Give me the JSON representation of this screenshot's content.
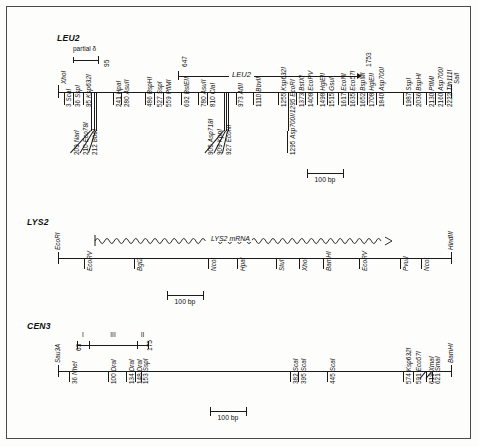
{
  "figure": {
    "title_hidden": "Restriction maps of LEU2, LYS2 and CEN3",
    "scalebar_label": "100 bp"
  },
  "leu2": {
    "title": "LEU2",
    "partial_delta_label": "partial δ",
    "partial_delta_end": "95",
    "left_end_site": "XhoI",
    "right_end_site": "SalI",
    "gene_name": "LEU2",
    "gene_start": "647",
    "gene_end": "1753",
    "scalebar_label": "100 bp",
    "sites_top": [
      {
        "pos": "3",
        "enzyme": "ScaI",
        "x": 56.5
      },
      {
        "pos": "36",
        "enzyme": "SspI",
        "x": 65.5
      },
      {
        "pos": "95",
        "enzyme": "Ksp632I",
        "x": 76.0
      },
      {
        "pos": "241",
        "enzyme": "HpaI",
        "x": 106.0
      },
      {
        "pos": "280",
        "enzyme": "AsuII",
        "x": 114.0
      },
      {
        "pos": "486",
        "enzyme": "BspHI",
        "x": 137.5
      },
      {
        "pos": "527",
        "enzyme": "SspI",
        "x": 147.0
      },
      {
        "pos": "559",
        "enzyme": "PflMI",
        "x": 156.0
      },
      {
        "pos": "692",
        "enzyme": "BstEII",
        "x": 174.0
      },
      {
        "pos": "780",
        "enzyme": "AsuII",
        "x": 191.0
      },
      {
        "pos": "810",
        "enzyme": "ClaI",
        "x": 200.0
      },
      {
        "pos": "973",
        "enzyme": "AflII",
        "x": 228.5
      },
      {
        "pos": "1110",
        "enzyme": "BbvII",
        "x": 246.0
      },
      {
        "pos": "1255",
        "enzyme": "Ksp632I",
        "x": 271.0
      },
      {
        "pos": "1373",
        "enzyme": "BstXI",
        "x": 289.0
      },
      {
        "pos": "1408",
        "enzyme": "EcoRV",
        "x": 298.0
      },
      {
        "pos": "1498",
        "enzyme": "HgiEII",
        "x": 310.0
      },
      {
        "pos": "1515",
        "enzyme": "GsuI",
        "x": 319.5
      },
      {
        "pos": "1617",
        "enzyme": "EcoNI",
        "x": 331.0
      },
      {
        "pos": "1635",
        "enzyme": "Eco57I",
        "x": 340.5
      },
      {
        "pos": "1652",
        "enzyme": "BspMI",
        "x": 350.0
      },
      {
        "pos": "1708",
        "enzyme": "HgiEII",
        "x": 359.5
      },
      {
        "pos": "1840",
        "enzyme": "Asp700I",
        "x": 369.0
      },
      {
        "pos": "1987",
        "enzyme": "SspI",
        "x": 396.0
      },
      {
        "pos": "2036",
        "enzyme": "BspHI",
        "x": 406.0
      },
      {
        "pos": "2130",
        "enzyme": "PflMI",
        "x": 419.0
      },
      {
        "pos": "2160",
        "enzyme": "Asp700I",
        "x": 428.0
      },
      {
        "pos": "2222",
        "enzyme": "Tth111I",
        "x": 437.5
      }
    ],
    "sites_bottom": [
      {
        "pos": "209",
        "enzyme": "NarI",
        "x": 84.0,
        "lx": 64.0
      },
      {
        "pos": "210",
        "enzyme": "Eco78I",
        "x": 86.5,
        "lx": 73.0
      },
      {
        "pos": "212",
        "enzyme": "BbeI",
        "x": 89.0,
        "lx": 82.0
      },
      {
        "pos": "905",
        "enzyme": "Asp718I",
        "x": 216.5,
        "lx": 198.0
      },
      {
        "pos": "909",
        "enzyme": "KpnI",
        "x": 218.5,
        "lx": 207.0
      },
      {
        "pos": "927",
        "enzyme": "EcoNI",
        "x": 221.0,
        "lx": 216.0
      },
      {
        "pos": "1295",
        "enzyme": "Asp700I/1295 EcoRI",
        "x": 280.5,
        "lx": 280.5
      }
    ]
  },
  "lys2": {
    "title": "LYS2",
    "left_end_site": "EcoRI",
    "right_end_site": "HindIII",
    "mrna_label": "LYS2 mRNA",
    "scalebar_label": "100 bp",
    "sites": [
      {
        "enzyme": "EcoRV",
        "x": 77.0
      },
      {
        "enzyme": "Bgl2",
        "x": 127.0
      },
      {
        "enzyme": "NcoI",
        "x": 201.0
      },
      {
        "enzyme": "HpaI",
        "x": 230.0
      },
      {
        "enzyme": "StuI",
        "x": 269.0
      },
      {
        "enzyme": "XhoI",
        "x": 292.0
      },
      {
        "enzyme": "BamHI",
        "x": 316.0
      },
      {
        "enzyme": "EcoRV",
        "x": 352.0
      },
      {
        "enzyme": "PvuII",
        "x": 393.0
      },
      {
        "enzyme": "NcoI",
        "x": 414.0
      }
    ]
  },
  "cen3": {
    "title": "CEN3",
    "left_end_site": "Sau3A",
    "right_end_site": "BamHI",
    "scalebar_label": "100 bp",
    "regions": [
      {
        "label": "I",
        "left": 70.0,
        "right": 82.0
      },
      {
        "label": "III",
        "left": 82.0,
        "right": 130.0
      },
      {
        "label": "II",
        "left": 130.0,
        "right": 141.0
      }
    ],
    "region_coord_left": "63",
    "region_coord_right": "175",
    "sites": [
      {
        "pos": "36",
        "enzyme": "NheI",
        "x": 62.0
      },
      {
        "pos": "100",
        "enzyme": "DraI",
        "x": 101.0
      },
      {
        "pos": "134",
        "enzyme": "DraI",
        "x": 119.0
      },
      {
        "pos": "148",
        "enzyme": "DraI",
        "x": 127.5
      },
      {
        "pos": "153",
        "enzyme": "SspI",
        "x": 133.5
      },
      {
        "pos": "382",
        "enzyme": "ScaI",
        "x": 283.0
      },
      {
        "pos": "395",
        "enzyme": "ScaI",
        "x": 291.0
      },
      {
        "pos": "445",
        "enzyme": "ScaI",
        "x": 320.0
      },
      {
        "pos": "574",
        "enzyme": "Ksp632I",
        "x": 396.0
      },
      {
        "pos": "591",
        "enzyme": "Eco57I",
        "x": 406.0
      },
      {
        "pos": "619",
        "enzyme": "XmaI",
        "x": 419.0
      },
      {
        "pos": "621",
        "enzyme": "SmaI",
        "x": 425.0
      }
    ]
  }
}
